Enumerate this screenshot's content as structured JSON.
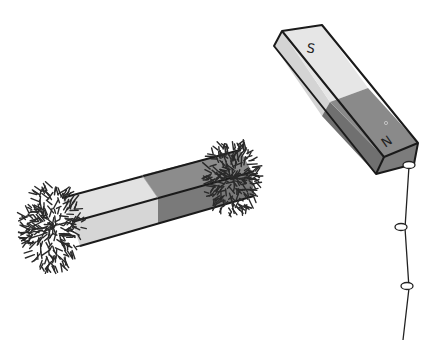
{
  "illustration": {
    "subject": "bar magnets with iron filings and suspended paper clips",
    "colors": {
      "background": "#ffffff",
      "south_pole_face": "#e4e4e4",
      "south_pole_side": "#d2d2d2",
      "north_pole_face": "#8a8a8a",
      "north_pole_side": "#6e6e6e",
      "outline": "#1a1a1a",
      "filings": "#2a2a2a"
    },
    "hanging_magnet": {
      "south_label": "S",
      "north_label": "N"
    },
    "filings_magnet": {
      "description": "bar magnet lying horizontally, iron filings clustered at both ends"
    },
    "paper_clip_chain": {
      "count": 3
    }
  }
}
